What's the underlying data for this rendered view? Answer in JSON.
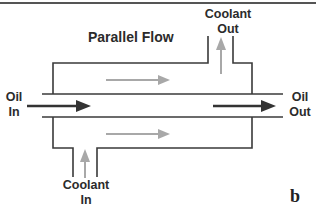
{
  "title": "Parallel Flow",
  "labels": {
    "oil_in": "Oil\nIn",
    "oil_in_line1": "Oil",
    "oil_in_line2": "In",
    "oil_out_line1": "Oil",
    "oil_out_line2": "Out",
    "coolant_out_line1": "Coolant",
    "coolant_out_line2": "Out",
    "coolant_in_line1": "Coolant",
    "coolant_in_line2": "In"
  },
  "panel_letter": "b",
  "colors": {
    "line": "#3a3a3a",
    "oil_arrow": "#333333",
    "coolant_arrow": "#a8a8a8",
    "background": "#ffffff"
  },
  "flows": [
    {
      "name": "oil",
      "direction": "left-to-right"
    },
    {
      "name": "coolant-upper",
      "direction": "left-to-right"
    },
    {
      "name": "coolant-lower",
      "direction": "left-to-right"
    },
    {
      "name": "coolant-inlet",
      "direction": "up"
    },
    {
      "name": "coolant-outlet",
      "direction": "up"
    }
  ]
}
